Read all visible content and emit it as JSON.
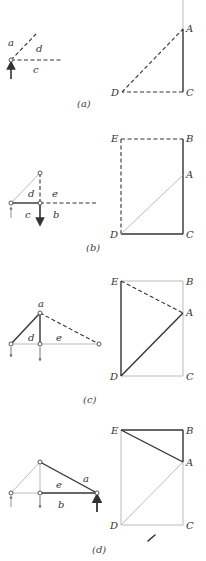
{
  "figure": {
    "panels": [
      {
        "caption": "(a)",
        "truss_labels": [
          "a",
          "d",
          "c"
        ],
        "polygon_labels": [
          "A",
          "C",
          "D"
        ]
      },
      {
        "caption": "(b)",
        "truss_labels": [
          "d",
          "e",
          "c",
          "b"
        ],
        "polygon_labels": [
          "E",
          "B",
          "A",
          "D",
          "C"
        ]
      },
      {
        "caption": "(c)",
        "truss_labels": [
          "a",
          "d",
          "e"
        ],
        "polygon_labels": [
          "E",
          "B",
          "A",
          "D",
          "C"
        ]
      },
      {
        "caption": "(d)",
        "truss_labels": [
          "e",
          "a",
          "b"
        ],
        "polygon_labels": [
          "E",
          "B",
          "A",
          "D",
          "C"
        ]
      }
    ],
    "colors": {
      "ink": "#333333",
      "construction": "#aaaaaa",
      "background": "#ffffff"
    }
  }
}
